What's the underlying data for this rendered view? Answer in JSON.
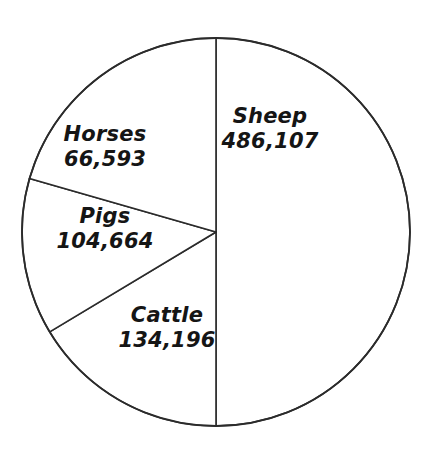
{
  "chart_data": {
    "type": "pie",
    "title": "",
    "subtitle": "",
    "xlabel": "",
    "ylabel": "",
    "legend_position": "none",
    "labels_inside": true,
    "grid": false,
    "total": 791560,
    "categories": [
      "Sheep",
      "Cattle",
      "Pigs",
      "Horses"
    ],
    "values": [
      486107,
      134196,
      104664,
      66593
    ],
    "value_labels": [
      "486,107",
      "134,196",
      "104,664",
      "66,593"
    ],
    "slices": [
      {
        "name": "Sheep",
        "value": 486107,
        "value_label": "486,107",
        "percent": 61.4,
        "start_angle_deg": 0,
        "end_angle_deg": 180,
        "color": "#ffffff",
        "stroke": "#2b2b2b"
      },
      {
        "name": "Cattle",
        "value": 134196,
        "value_label": "134,196",
        "percent": 17.0,
        "start_angle_deg": 180,
        "end_angle_deg": 239,
        "color": "#ffffff",
        "stroke": "#2b2b2b"
      },
      {
        "name": "Pigs",
        "value": 104664,
        "value_label": "104,664",
        "percent": 13.2,
        "start_angle_deg": 239,
        "end_angle_deg": 286,
        "color": "#ffffff",
        "stroke": "#2b2b2b"
      },
      {
        "name": "Horses",
        "value": 66593,
        "value_label": "66,593",
        "percent": 8.4,
        "start_angle_deg": 286,
        "end_angle_deg": 360,
        "color": "#ffffff",
        "stroke": "#2b2b2b"
      }
    ]
  },
  "labels": {
    "sheep": {
      "name": "Sheep",
      "value": "486,107"
    },
    "horses": {
      "name": "Horses",
      "value": "66,593"
    },
    "pigs": {
      "name": "Pigs",
      "value": "104,664"
    },
    "cattle": {
      "name": "Cattle",
      "value": "134,196"
    }
  },
  "style": {
    "background": "#ffffff",
    "line_color": "#2b2b2b",
    "text_color": "#151515"
  }
}
